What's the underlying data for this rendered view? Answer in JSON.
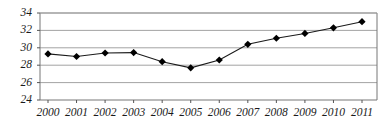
{
  "chart_data": {
    "type": "line",
    "title": "",
    "subtitle": "",
    "xlabel": "",
    "ylabel": "",
    "categories": [
      "2000",
      "2001",
      "2002",
      "2003",
      "2004",
      "2005",
      "2006",
      "2007",
      "2008",
      "2009",
      "2010",
      "2011"
    ],
    "values": [
      29.3,
      29.0,
      29.4,
      29.45,
      28.4,
      27.7,
      28.6,
      30.4,
      31.1,
      31.65,
      32.3,
      33.0
    ],
    "series": [
      {
        "name": "series-1",
        "values": [
          29.3,
          29.0,
          29.4,
          29.45,
          28.4,
          27.7,
          28.6,
          30.4,
          31.1,
          31.65,
          32.3,
          33.0
        ]
      }
    ],
    "ylim": [
      24,
      34
    ],
    "yticks": [
      24,
      26,
      28,
      30,
      32,
      34
    ],
    "ytick_labels": [
      "24",
      "26",
      "28",
      "30",
      "32",
      "34"
    ],
    "xtick_labels": [
      "2000",
      "2001",
      "2002",
      "2003",
      "2004",
      "2005",
      "2006",
      "2007",
      "2008",
      "2009",
      "2010",
      "2011"
    ],
    "grid": true,
    "grid_axis": "y",
    "legend": false,
    "legend_position": "none",
    "marker": "diamond",
    "line_color": "#1a1a1a",
    "marker_color": "#000000",
    "grid_color": "#999999",
    "axis_color": "#666666",
    "background_color": "#ffffff",
    "annotations": []
  },
  "axes": {
    "y_axis_name": "value-axis",
    "x_axis_name": "year-axis"
  }
}
